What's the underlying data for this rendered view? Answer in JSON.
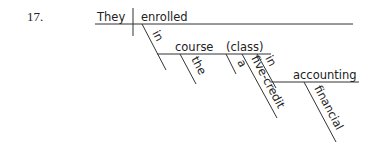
{
  "exercise_number": "17.",
  "diagram": {
    "type": "sentence-diagram",
    "subject": "They",
    "verb": "enrolled",
    "modifiers": {
      "prep1": "in",
      "prep1_object": "course",
      "appositive": "(class)",
      "article_the": "the",
      "article_a": "a",
      "adjective": "five-credit",
      "prep2": "in",
      "prep2_object": "accounting",
      "prep2_adjective": "financial"
    }
  }
}
